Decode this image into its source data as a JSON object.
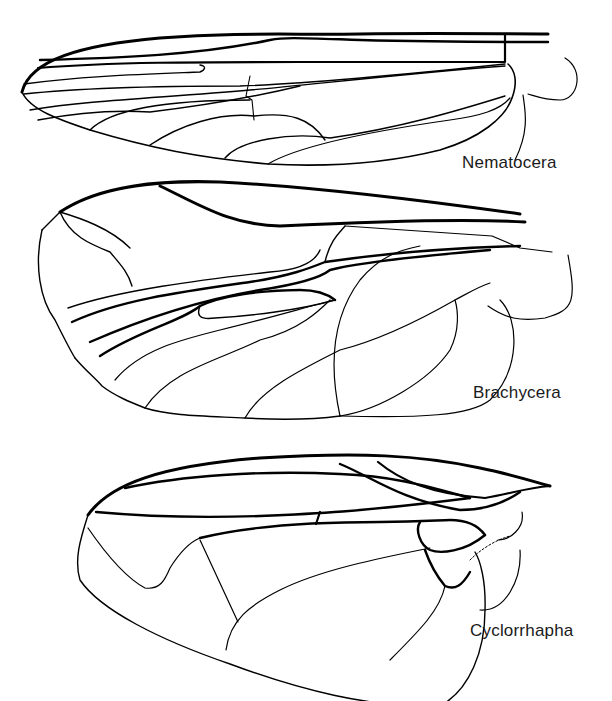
{
  "figure": {
    "type": "comparative wing venation illustration",
    "background": "#ffffff",
    "line_color": "#000000",
    "wings": [
      {
        "id": "nematocera",
        "label": "Nematocera"
      },
      {
        "id": "brachycera",
        "label": "Brachycera"
      },
      {
        "id": "cyclorrhapha",
        "label": "Cyclorrhapha"
      }
    ]
  }
}
